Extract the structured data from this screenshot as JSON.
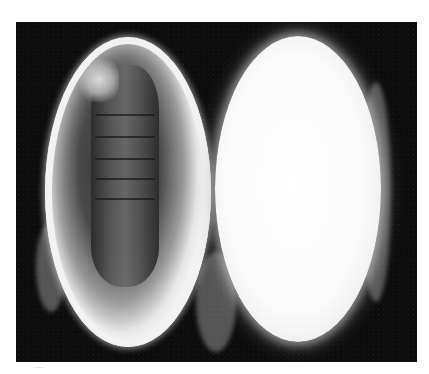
{
  "image": {
    "subject": "Two halves of a silk cocoon on a black background",
    "left_half": "cocoon cut open revealing a segmented pupa inside",
    "right_half": "intact white silk cocoon exterior",
    "background_color": "#0d0d0d",
    "cocoon_color": "#f5f5f5",
    "pupa_color": "#4a4a4a"
  },
  "caption": {
    "text": "···"
  }
}
